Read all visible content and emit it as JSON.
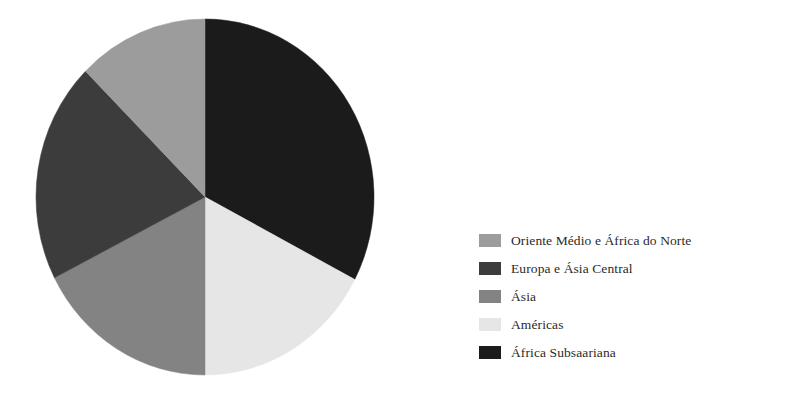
{
  "chart_data": {
    "type": "pie",
    "title": "",
    "subtitle": "",
    "xlabel": "",
    "ylabel": "",
    "grid": false,
    "legend_position": "right",
    "start_angle_deg": 0,
    "direction": "clockwise",
    "categories": [
      "África Subsaariana",
      "Américas",
      "Ásia",
      "Europa e Ásia Central",
      "Oriente Médio e África do Norte"
    ],
    "values": [
      32.7,
      17.3,
      17.5,
      20.0,
      12.5
    ],
    "slices": [
      {
        "label": "África Subsaariana",
        "value": 32.7,
        "color": "#1b1b1b",
        "start_deg": 0,
        "end_deg": 117.6
      },
      {
        "label": "Américas",
        "value": 17.3,
        "color": "#e6e6e6",
        "start_deg": 117.6,
        "end_deg": 180
      },
      {
        "label": "Ásia",
        "value": 17.5,
        "color": "#838383",
        "start_deg": 180,
        "end_deg": 243
      },
      {
        "label": "Europa e Ásia Central",
        "value": 20.0,
        "color": "#3c3c3c",
        "start_deg": 243,
        "end_deg": 315
      },
      {
        "label": "Oriente Médio e África do Norte",
        "value": 12.5,
        "color": "#9c9c9c",
        "start_deg": 315,
        "end_deg": 360
      }
    ]
  },
  "legend": {
    "items": [
      {
        "label": "Oriente Médio e África do Norte",
        "color": "#9c9c9c"
      },
      {
        "label": "Europa e Ásia Central",
        "color": "#3c3c3c"
      },
      {
        "label": "Ásia",
        "color": "#838383"
      },
      {
        "label": "Américas",
        "color": "#e6e6e6"
      },
      {
        "label": "África Subsaariana",
        "color": "#1b1b1b"
      }
    ]
  },
  "geometry": {
    "center_x": 172,
    "center_y": 181,
    "radius_x": 169,
    "radius_y": 178
  }
}
